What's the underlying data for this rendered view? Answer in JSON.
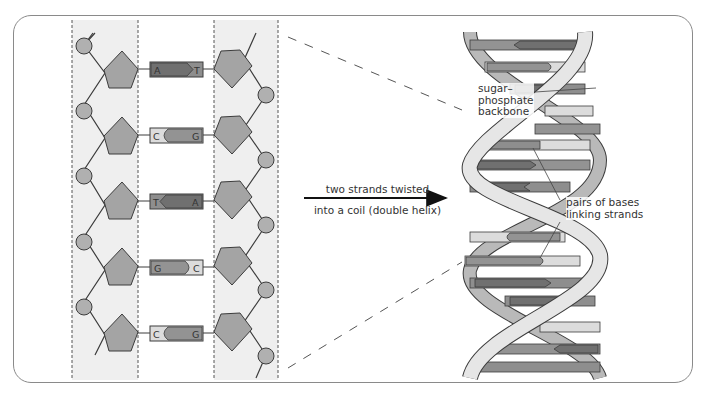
{
  "diagram": {
    "colors": {
      "frame": "#8a8a8a",
      "strand_band": "#eeeeee",
      "sugar_pentagon": "#a4a4a4",
      "phosphate_circle": "#b0b0b0",
      "outline": "#3c3c3c",
      "base_A": "#707070",
      "base_T": "#8e8e8e",
      "base_C": "#dcdcdc",
      "base_G": "#939393",
      "ribbon_front": "#e6e6e6",
      "ribbon_back": "#b9b9b9"
    },
    "ladder": {
      "base_pairs": [
        {
          "left": "A",
          "right": "T"
        },
        {
          "left": "C",
          "right": "G"
        },
        {
          "left": "T",
          "right": "A"
        },
        {
          "left": "G",
          "right": "C"
        },
        {
          "left": "C",
          "right": "G"
        }
      ]
    },
    "arrow": {
      "line1": "two strands twisted",
      "line2": "into a coil (double helix)"
    },
    "helix_labels": {
      "backbone_line1": "sugar–",
      "backbone_line2": "phosphate",
      "backbone_line3": "backbone",
      "bases_line1": "pairs of bases",
      "bases_line2": "linking strands"
    }
  }
}
